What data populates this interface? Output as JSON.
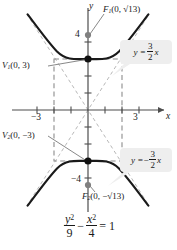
{
  "figure": {
    "type": "hyperbola-graph",
    "equation": {
      "numerator_left": "y",
      "denominator_left": "9",
      "numerator_right": "x",
      "denominator_right": "4",
      "operator": "−",
      "equals": "= 1",
      "plain": "y²/9 − x²/4 = 1"
    },
    "axes": {
      "x_name": "x",
      "y_name": "y",
      "x_ticks_labeled": [
        "−3",
        "3"
      ],
      "y_ticks_labeled": [
        "4",
        "−4"
      ],
      "x_range": [
        -4.6,
        4.6
      ],
      "y_range": [
        -5.6,
        5.6
      ]
    },
    "points": [
      {
        "name": "F₁",
        "label_base": "F",
        "label_sub": "1",
        "label_rest": "(0, √13)",
        "x": 0,
        "y": 3.6056,
        "style": "focus"
      },
      {
        "name": "F₂",
        "label_base": "F",
        "label_sub": "2",
        "label_rest": "(0, −√13)",
        "x": 0,
        "y": -3.6056,
        "style": "focus"
      },
      {
        "name": "V₁",
        "label_base": "V",
        "label_sub": "1",
        "label_rest": "(0, 3)",
        "x": 0,
        "y": 3,
        "style": "vertex"
      },
      {
        "name": "V₂",
        "label_base": "V",
        "label_sub": "2",
        "label_rest": "(0, −3)",
        "x": 0,
        "y": -3,
        "style": "vertex"
      }
    ],
    "asymptotes": [
      {
        "callout_lhs": "y =",
        "sign": "",
        "num": "3",
        "den": "2",
        "var": "x",
        "plain": "y = 3/2 x",
        "slope": 1.5
      },
      {
        "callout_lhs": "y =",
        "sign": "−",
        "num": "3",
        "den": "2",
        "var": "x",
        "plain": "y = −3/2 x",
        "slope": -1.5
      }
    ],
    "central_box": {
      "x_half_width": 2,
      "y_half_height": 3
    },
    "colors": {
      "curve": "#1a1a1a",
      "axis": "#4d4d4d",
      "dashed": "#8c8c8c",
      "asymptote": "#b3b3b3",
      "vertex_dot": "#111111",
      "focus_dot": "#808080",
      "callout_bg": "#eeeeee",
      "leader": "#777777"
    }
  }
}
